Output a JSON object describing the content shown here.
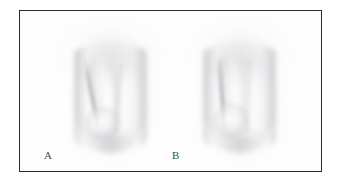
{
  "figure": {
    "kind": "clinical-photograph-figure",
    "frame": {
      "border_color": "#2b2b2e",
      "background_color": "#ffffff"
    },
    "panels": [
      {
        "id": "panel-a",
        "label": "A",
        "specimen_tone": "#e8e8ea",
        "shadow_tone": "#b0b0b4",
        "ridge_orientation": "oblique"
      },
      {
        "id": "panel-b",
        "label": "B",
        "specimen_tone": "#e8e8ea",
        "shadow_tone": "#b0b0b4",
        "ridge_orientation": "upright"
      }
    ]
  }
}
